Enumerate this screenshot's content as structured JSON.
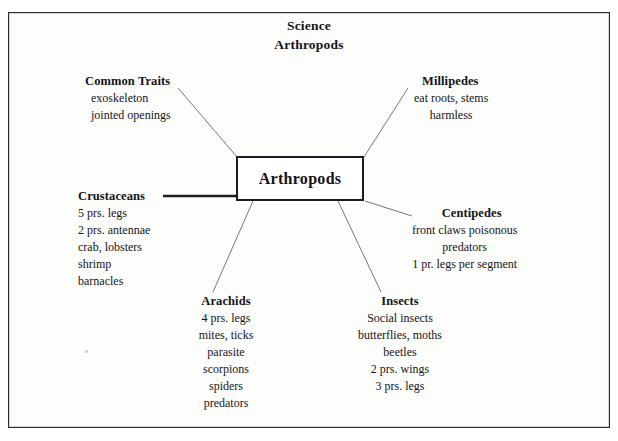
{
  "title": {
    "line1": "Science",
    "line2": "Arthropods"
  },
  "center": {
    "label": "Arthropods"
  },
  "nodes": [
    {
      "id": "common-traits",
      "head": "Common Traits",
      "lines": [
        "exoskeleton",
        "jointed openings"
      ]
    },
    {
      "id": "millipedes",
      "head": "Millipedes",
      "lines": [
        "eat roots, stems",
        "harmless"
      ]
    },
    {
      "id": "crustaceans",
      "head": "Crustaceans",
      "lines": [
        "5 prs. legs",
        "2 prs. antennae",
        "crab, lobsters",
        "shrimp",
        "barnacles"
      ]
    },
    {
      "id": "centipedes",
      "head": "Centipedes",
      "lines": [
        "front claws poisonous",
        "predators",
        "1 pr. legs per segment"
      ]
    },
    {
      "id": "arachids",
      "head": "Arachids",
      "lines": [
        "4 prs. legs",
        "mites, ticks",
        "parasite",
        "scorpions",
        "spiders",
        "predators"
      ]
    },
    {
      "id": "insects",
      "head": "Insects",
      "lines": [
        "Social insects",
        "butterflies, moths",
        "beetles",
        "2 prs. wings",
        "3 prs. legs"
      ]
    }
  ],
  "colors": {
    "ink": "#14141a",
    "frame": "#2b2b30",
    "box_border": "#1b1b20",
    "connector": "#6e6e74",
    "page": "#fdfdfc"
  }
}
